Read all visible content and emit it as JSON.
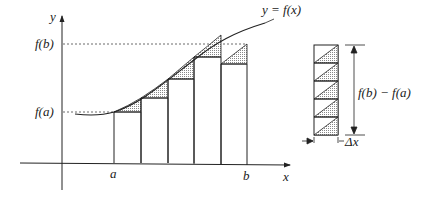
{
  "diagram": {
    "labels": {
      "y_axis": "y",
      "x_axis": "x",
      "fb": "f(b)",
      "fa": "f(a)",
      "a": "a",
      "b": "b",
      "curve": "y = f(x)",
      "height_label": "f(b) − f(a)",
      "width_label": "Δx"
    },
    "colors": {
      "line": "#222222",
      "shade": "#c8c8c8"
    },
    "subintervals": 5
  }
}
